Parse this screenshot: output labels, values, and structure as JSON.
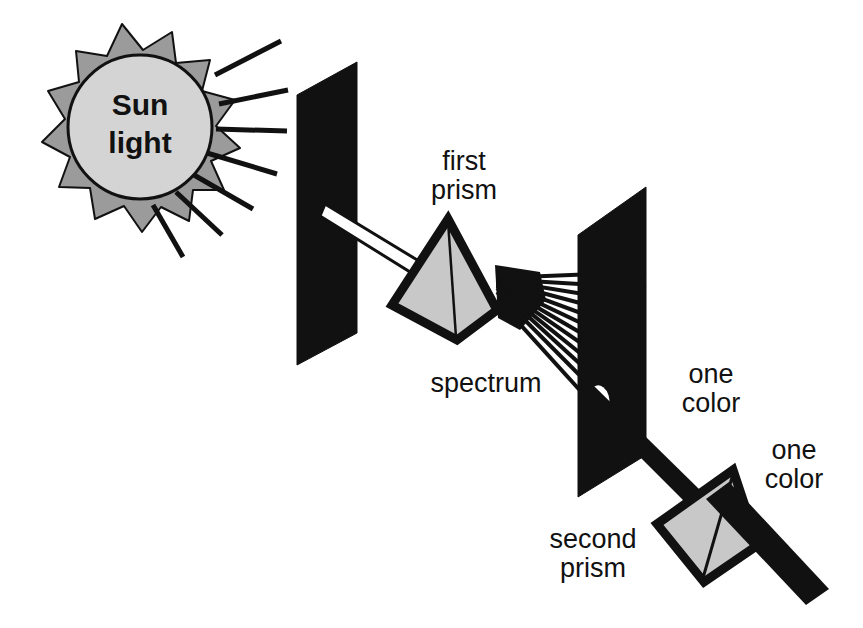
{
  "diagram": {
    "canvas": {
      "width": 863,
      "height": 628,
      "background": "#ffffff"
    },
    "colors": {
      "screen_black": "#111111",
      "prism_fill": "#c8c8c8",
      "prism_outline": "#111111",
      "sun_disc": "#d4d4d4",
      "sun_rays_fill": "#9b9b9b",
      "beam_white": "#ffffff",
      "beam_black": "#111111",
      "text": "#111111"
    },
    "labels": {
      "sun_line1": "Sun",
      "sun_line2": "light",
      "first_prism_line1": "first",
      "first_prism_line2": "prism",
      "spectrum": "spectrum",
      "one_color_upper_line1": "one",
      "one_color_upper_line2": "color",
      "one_color_lower_line1": "one",
      "one_color_lower_line2": "color",
      "second_prism_line1": "second",
      "second_prism_line2": "prism"
    },
    "elements": {
      "sun_name": "sun",
      "sunbeam_name": "sunlight-rays",
      "screen_one_name": "first-screen",
      "screen_two_name": "second-screen",
      "prism_one_name": "first-prism",
      "prism_two_name": "second-prism",
      "white_beam_name": "white-light-beam",
      "spectrum_name": "spectrum-fan",
      "hole_name": "aperture-hole",
      "single_color_beam_name": "single-color-beam",
      "exit_beam_name": "exit-beam"
    },
    "spectrum_ray_count": 12
  }
}
